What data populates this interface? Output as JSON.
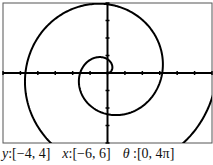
{
  "chart_data": {
    "type": "line",
    "subtype": "polar",
    "title": "",
    "equation": "r = θ/2",
    "theta_range": [
      0,
      "4π"
    ],
    "xlim": [
      -6,
      6
    ],
    "ylim": [
      -4,
      4
    ],
    "x_tick_step": 1,
    "y_tick_step": 1,
    "grid": false,
    "line_color": "#000000",
    "series": [
      {
        "name": "spiral",
        "theta_start": 0,
        "theta_end": 12.566,
        "r_factor": 0.5
      }
    ]
  },
  "caption": {
    "y_label": "y",
    "y_range": ":[−4, 4]",
    "x_label": "x",
    "x_range": ":[−6, 6]",
    "theta_label": "θ",
    "theta_range": " :[0, 4π]"
  }
}
